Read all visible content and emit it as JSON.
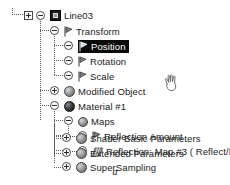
{
  "figure": {
    "caption": "a"
  },
  "cursor": {
    "icon": "hand-cursor",
    "x": 160,
    "y": 70
  },
  "tree": {
    "root_label": "Line03",
    "nodes": [
      {
        "id": "line03",
        "label": "Line03",
        "depth": 0,
        "icon": "object-icon",
        "expander": "minus",
        "extra_expander": "plus",
        "selected": false
      },
      {
        "id": "transform",
        "label": "Transform",
        "depth": 1,
        "icon": "controller-icon",
        "expander": "minus",
        "selected": false
      },
      {
        "id": "position",
        "label": "Position",
        "depth": 2,
        "icon": "controller-icon",
        "expander": "none-circle",
        "selected": true
      },
      {
        "id": "rotation",
        "label": "Rotation",
        "depth": 2,
        "icon": "controller-icon",
        "expander": "none-circle",
        "selected": false
      },
      {
        "id": "scale",
        "label": "Scale",
        "depth": 2,
        "icon": "controller-icon",
        "expander": "none-circle",
        "selected": false
      },
      {
        "id": "modified-object",
        "label": "Modified Object",
        "depth": 1,
        "icon": "sphere-grey-icon",
        "expander": "plus",
        "selected": false
      },
      {
        "id": "material-1",
        "label": "Material #1",
        "depth": 1,
        "icon": "sphere-dark-icon",
        "expander": "minus",
        "selected": false
      },
      {
        "id": "maps",
        "label": "Maps",
        "depth": 2,
        "icon": "sphere-grey-icon",
        "expander": "minus",
        "selected": false
      },
      {
        "id": "reflection-amount",
        "label": "Reflection Amount",
        "depth": 3,
        "icon": "controller-icon",
        "expander": "none-circle",
        "selected": false
      },
      {
        "id": "reflection-map-3",
        "label": "Reflection: Map #3  ( Reflect/Refr",
        "depth": 3,
        "icon": "map-icon",
        "expander": "plus",
        "selected": false,
        "truncated": true
      },
      {
        "id": "shader-basic-parameters",
        "label": "Shader Basic Parameters",
        "depth": 2,
        "icon": "sphere-grey-icon",
        "expander": "plus",
        "selected": false
      },
      {
        "id": "extended-parameters",
        "label": "Extended Parameters",
        "depth": 2,
        "icon": "sphere-grey-icon",
        "expander": "plus",
        "selected": false
      },
      {
        "id": "supersampling",
        "label": "SuperSampling",
        "depth": 2,
        "icon": "sphere-grey-icon",
        "expander": "plus",
        "selected": false
      }
    ]
  },
  "colors": {
    "selection_background": "#0a0a0a",
    "selection_text": "#ffffff",
    "line": "#5a5a5a",
    "text": "#1a1a1a",
    "background": "#ffffff"
  }
}
